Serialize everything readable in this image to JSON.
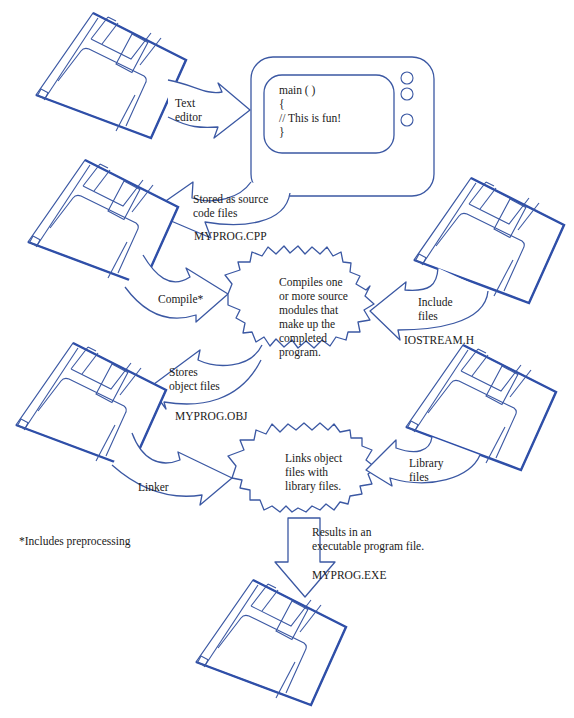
{
  "diagram": {
    "colors": {
      "line": "#3b58a3",
      "text": "#1a1a1a",
      "background": "#ffffff"
    },
    "monitor": {
      "code_lines": [
        "main ( )",
        "{",
        "// This is fun!",
        "}"
      ]
    },
    "arrows": {
      "text_editor": [
        "Text",
        "editor"
      ],
      "stored_source": [
        "Stored as source",
        "code files"
      ],
      "compile": "Compile*",
      "include_files": [
        "Include",
        "files"
      ],
      "stores_object": [
        "Stores",
        "object files"
      ],
      "linker": "Linker",
      "library_files": [
        "Library",
        "files"
      ],
      "results": [
        "Results in an",
        "executable program file."
      ]
    },
    "bursts": {
      "compile": [
        "Compiles one",
        "or more source",
        "modules that",
        "make up the",
        "completed",
        "program."
      ],
      "link": [
        "Links object",
        "files with",
        "library files."
      ]
    },
    "files": {
      "source": "MYPROG.CPP",
      "header": "IOSTREAM.H",
      "object": "MYPROG.OBJ",
      "executable": "MYPROG.EXE"
    },
    "footnote": "*Includes preprocessing"
  }
}
